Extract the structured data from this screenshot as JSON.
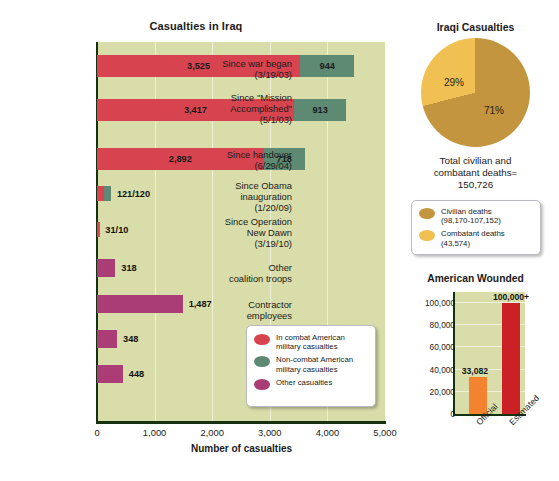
{
  "chart_data": [
    {
      "type": "bar",
      "id": "casualties-in-iraq",
      "title": "Casualties in Iraq",
      "orientation": "horizontal",
      "stacked": true,
      "xlabel": "Number of casualties",
      "ylabel": "",
      "xlim": [
        0,
        5000
      ],
      "xticks": [
        "0",
        "1,000",
        "2,000",
        "3,000",
        "4,000",
        "5,000"
      ],
      "xtick_values": [
        0,
        1000,
        2000,
        3000,
        4000,
        5000
      ],
      "grid": "vertical-faint",
      "legend_position": "inside-bottom-right",
      "legend": [
        {
          "label": "In combat American military casualties",
          "color": "#d7444f",
          "key": "combat"
        },
        {
          "label": "Non-combat American military casualties",
          "color": "#5e8a73",
          "key": "noncombat"
        },
        {
          "label": "Other casualties",
          "color": "#ab3d76",
          "key": "other"
        }
      ],
      "categories": [
        "Since war began (3/19/03)",
        "Since \"Mission Accomplished\" (5/1/03)",
        "Since handover (6/29/04)",
        "Since Obama inauguration (1/20/09)",
        "Since Operation New Dawn (3/19/10)",
        "Other coalition troops",
        "Contractor employees",
        "Journalists",
        "Academics"
      ],
      "rows": [
        {
          "label_lines": [
            "Since war began",
            "(3/19/03)"
          ],
          "combat": 3525,
          "noncombat": 944,
          "other": 0,
          "labels": [
            {
              "text": "3,525",
              "place": "inside-combat"
            },
            {
              "text": "944",
              "place": "inside-noncombat"
            }
          ]
        },
        {
          "label_lines": [
            "Since \"Mission",
            "Accomplished\"",
            "(5/1/03)"
          ],
          "combat": 3417,
          "noncombat": 913,
          "other": 0,
          "labels": [
            {
              "text": "3,417",
              "place": "inside-combat"
            },
            {
              "text": "913",
              "place": "inside-noncombat"
            }
          ]
        },
        {
          "label_lines": [
            "Since handover",
            "(6/29/04)"
          ],
          "combat": 2892,
          "noncombat": 718,
          "other": 0,
          "labels": [
            {
              "text": "2,892",
              "place": "inside-combat"
            },
            {
              "text": "718",
              "place": "inside-noncombat"
            }
          ]
        },
        {
          "label_lines": [
            "Since Obama",
            "inauguration",
            "(1/20/09)"
          ],
          "combat": 121,
          "noncombat": 120,
          "other": 0,
          "labels": [
            {
              "text": "121/120",
              "place": "outside"
            }
          ]
        },
        {
          "label_lines": [
            "Since Operation",
            "New Dawn",
            "(3/19/10)"
          ],
          "combat": 31,
          "noncombat": 10,
          "other": 0,
          "labels": [
            {
              "text": "31/10",
              "place": "outside"
            }
          ]
        },
        {
          "label_lines": [
            "Other",
            "coalition troops"
          ],
          "combat": 0,
          "noncombat": 0,
          "other": 318,
          "labels": [
            {
              "text": "318",
              "place": "outside"
            }
          ]
        },
        {
          "label_lines": [
            "Contractor",
            "employees"
          ],
          "combat": 0,
          "noncombat": 0,
          "other": 1487,
          "labels": [
            {
              "text": "1,487",
              "place": "outside"
            }
          ]
        },
        {
          "label_lines": [
            "Journalists"
          ],
          "combat": 0,
          "noncombat": 0,
          "other": 348,
          "labels": [
            {
              "text": "348",
              "place": "outside"
            }
          ]
        },
        {
          "label_lines": [
            "Academics"
          ],
          "combat": 0,
          "noncombat": 0,
          "other": 448,
          "labels": [
            {
              "text": "448",
              "place": "outside"
            }
          ]
        }
      ]
    },
    {
      "type": "pie",
      "id": "iraqi-casualties",
      "title": "Iraqi Casualties",
      "slices": [
        {
          "label": "Civilian deaths",
          "sublabel": "(98,170-107,152)",
          "percent": 71,
          "display": "71%",
          "color": "#c3953f"
        },
        {
          "label": "Combatant deaths",
          "sublabel": "(43,574)",
          "percent": 29,
          "display": "29%",
          "color": "#f0c053"
        }
      ],
      "total_caption": "Total civilian and\ncombatant deaths=\n150,726",
      "total_caption_lines": [
        "Total civilian and",
        "combatant deaths=",
        "150,726"
      ],
      "legend_position": "below"
    },
    {
      "type": "bar",
      "id": "american-wounded",
      "title": "American Wounded",
      "categories": [
        "Official",
        "Estimated"
      ],
      "values": [
        33082,
        100000
      ],
      "value_labels": [
        "33,082",
        "100,000+"
      ],
      "colors": [
        "#f4832f",
        "#cc2027"
      ],
      "ylim": [
        0,
        110000
      ],
      "yticks": [
        "0",
        "20,000",
        "40,000",
        "60,000",
        "80,000",
        "100,000"
      ],
      "ytick_values": [
        0,
        20000,
        40000,
        60000,
        80000,
        100000
      ],
      "xlabel": "",
      "ylabel": "",
      "grid": "horizontal-faint"
    }
  ],
  "main": {
    "title": "Casualties in Iraq",
    "x_axis_title": "Number of casualties"
  },
  "pie_panel": {
    "title": "Iraqi Casualties"
  },
  "wounded_panel": {
    "title": "American Wounded"
  }
}
